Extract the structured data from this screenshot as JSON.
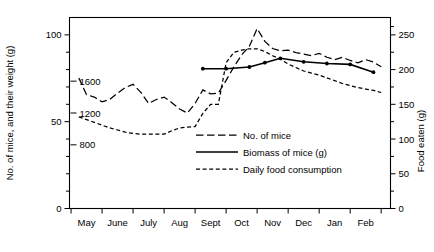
{
  "chart_data": {
    "type": "line",
    "title": "",
    "xlabel": "",
    "ylabel": "No. of mice, and their weight (g)",
    "y2label": "Food eaten (g)",
    "grid": false,
    "legend_position": "center",
    "x_tick_labels": [
      "May",
      "June",
      "July",
      "Aug",
      "Sept",
      "Oct",
      "Nov",
      "Dec",
      "Jan",
      "Feb"
    ],
    "y_left_ticks": [
      0,
      50,
      100
    ],
    "y_left_minor_ticks": [
      10,
      20,
      30,
      40,
      60,
      70,
      80,
      90
    ],
    "y_left_lim": [
      0,
      110
    ],
    "y_inner_ticks": [
      800,
      1200,
      1600
    ],
    "y_inner_lim": [
      0,
      2400
    ],
    "y_right_ticks": [
      0,
      50,
      100,
      150,
      200,
      250
    ],
    "y_right_lim": [
      0,
      275
    ],
    "series": [
      {
        "name": "No. of mice",
        "style": "long-dash",
        "markers": false,
        "x": [
          0.3,
          0.55,
          0.8,
          1.05,
          1.3,
          1.55,
          1.8,
          2.05,
          2.3,
          2.55,
          2.8,
          3.05,
          3.3,
          3.55,
          3.8,
          4.05,
          4.3,
          4.55,
          4.8,
          5.05,
          5.3,
          5.55,
          5.8,
          6.05,
          6.3,
          6.55,
          6.8,
          7.05,
          7.3,
          7.55,
          7.8,
          8.05,
          8.3,
          8.55,
          8.8,
          9.05,
          9.3,
          9.55,
          9.8,
          10.05
        ],
        "values": [
          1640,
          1430,
          1400,
          1340,
          1370,
          1450,
          1520,
          1560,
          1460,
          1320,
          1370,
          1400,
          1330,
          1250,
          1200,
          1320,
          1490,
          1440,
          1450,
          1610,
          1780,
          1930,
          2040,
          2260,
          2100,
          2010,
          1980,
          1990,
          1960,
          1940,
          1920,
          1950,
          1900,
          1870,
          1900,
          1860,
          1830,
          1870,
          1840,
          1780
        ],
        "units": "number of mice (inner scale 0-2400)"
      },
      {
        "name": "Biomass of mice (g)",
        "style": "solid",
        "markers": true,
        "x": [
          4.3,
          5.05,
          5.8,
          6.3,
          6.8,
          7.55,
          8.3,
          9.05,
          9.8
        ],
        "values": [
          80.5,
          80.5,
          81.5,
          84.0,
          86.5,
          84.5,
          83.5,
          83.0,
          78.5
        ],
        "units": "g (left scale 0-110)"
      },
      {
        "name": "Daily food consumption",
        "style": "short-dash",
        "markers": false,
        "x": [
          0.3,
          0.55,
          0.8,
          1.05,
          1.3,
          1.55,
          1.8,
          2.05,
          2.3,
          2.55,
          2.8,
          3.05,
          3.3,
          3.55,
          3.8,
          4.05,
          4.3,
          4.55,
          4.8,
          5.05,
          5.3,
          5.55,
          5.8,
          6.05,
          6.3,
          6.55,
          6.8,
          7.05,
          7.3,
          7.55,
          7.8,
          8.05,
          8.3,
          8.55,
          8.8,
          9.05,
          9.3,
          9.55,
          9.8,
          10.05
        ],
        "values": [
          132,
          128,
          124,
          120,
          116,
          113,
          110,
          108,
          107,
          107,
          107,
          107,
          112,
          116,
          117,
          118,
          137,
          150,
          150,
          210,
          225,
          228,
          230,
          230,
          226,
          220,
          215,
          208,
          203,
          198,
          195,
          192,
          188,
          184,
          180,
          177,
          174,
          172,
          170,
          167
        ],
        "units": "g (right scale 0-275)"
      }
    ],
    "legend": [
      {
        "label": "No. of mice",
        "style": "long-dash"
      },
      {
        "label": "Biomass of mice (g)",
        "style": "solid"
      },
      {
        "label": "Daily food consumption",
        "style": "short-dash"
      }
    ]
  }
}
